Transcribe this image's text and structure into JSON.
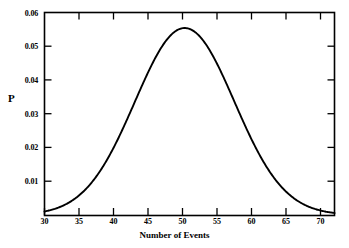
{
  "chart_data": {
    "type": "line",
    "title": "",
    "xlabel": "Number of Events",
    "ylabel": "P",
    "xlim": [
      30,
      72
    ],
    "ylim": [
      0,
      0.06
    ],
    "grid": false,
    "legend": null,
    "xticks": [
      30,
      35,
      40,
      45,
      50,
      55,
      60,
      65,
      70
    ],
    "xtick_labels": [
      "30",
      "35",
      "40",
      "45",
      "50",
      "55",
      "60",
      "65",
      "70"
    ],
    "yticks": [
      0.01,
      0.02,
      0.03,
      0.04,
      0.05,
      0.06
    ],
    "ytick_labels": [
      "0.01",
      "0.02",
      "0.03",
      "0.04",
      "0.05",
      "0.06"
    ],
    "line_color": "#000000",
    "distribution": {
      "mean": 50.3,
      "sigma": 7.2,
      "peak_x": 50.3,
      "peak_y": 0.0554
    },
    "x": [
      30,
      31,
      32,
      33,
      34,
      35,
      36,
      37,
      38,
      39,
      40,
      41,
      42,
      43,
      44,
      45,
      46,
      47,
      48,
      49,
      50,
      51,
      52,
      53,
      54,
      55,
      56,
      57,
      58,
      59,
      60,
      61,
      62,
      63,
      64,
      65,
      66,
      67,
      68,
      69,
      70,
      71,
      72
    ],
    "y": [
      0.0005,
      0.0008,
      0.0012,
      0.0019,
      0.0028,
      0.0041,
      0.0058,
      0.008,
      0.0107,
      0.014,
      0.0178,
      0.0221,
      0.0268,
      0.0317,
      0.0366,
      0.0413,
      0.0456,
      0.0494,
      0.0524,
      0.0545,
      0.0554,
      0.0554,
      0.0545,
      0.0524,
      0.0494,
      0.0456,
      0.0413,
      0.0366,
      0.0317,
      0.0268,
      0.0221,
      0.0178,
      0.014,
      0.0107,
      0.008,
      0.0058,
      0.0041,
      0.0028,
      0.0019,
      0.0012,
      0.0008,
      0.0005,
      0.0003
    ]
  },
  "axis": {
    "ylabel": "P",
    "xlabel": "Number of Events",
    "ytick_labels": [
      "0.06",
      "0.05",
      "0.04",
      "0.03",
      "0.02",
      "0.01"
    ],
    "xtick_labels": [
      "30",
      "35",
      "40",
      "45",
      "50",
      "55",
      "60",
      "65",
      "70"
    ]
  }
}
